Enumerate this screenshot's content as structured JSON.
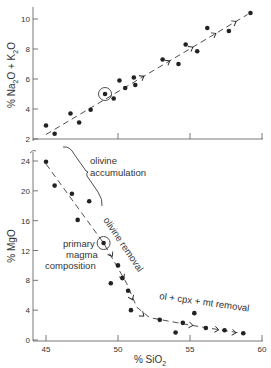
{
  "figure": {
    "width": 271,
    "height": 368,
    "ink_color": "#222222",
    "axis_color": "#555555",
    "text_color": "#333333"
  },
  "chart_data": [
    {
      "type": "scatter",
      "title": "",
      "xlabel": "% SiO2",
      "ylabel": "% Na2O + K2O",
      "xlim": [
        45,
        60
      ],
      "ylim": [
        2,
        10.5
      ],
      "x_ticks": [
        45,
        50,
        55,
        60
      ],
      "y_ticks": [
        2,
        4,
        6,
        8,
        10
      ],
      "y_tick_labels": [
        "2",
        "4",
        "6",
        "8",
        "10"
      ],
      "grid": false,
      "legend": null,
      "series": [
        {
          "name": "samples",
          "points": [
            [
              45.0,
              2.9
            ],
            [
              45.6,
              2.35
            ],
            [
              46.7,
              3.7
            ],
            [
              47.3,
              3.1
            ],
            [
              48.1,
              3.95
            ],
            [
              49.1,
              5.0
            ],
            [
              49.7,
              4.7
            ],
            [
              50.1,
              5.9
            ],
            [
              50.5,
              5.4
            ],
            [
              51.1,
              6.1
            ],
            [
              51.2,
              5.6
            ],
            [
              53.1,
              7.3
            ],
            [
              54.2,
              7.0
            ],
            [
              54.7,
              8.3
            ],
            [
              55.5,
              7.85
            ],
            [
              56.2,
              9.4
            ],
            [
              57.7,
              9.2
            ],
            [
              59.2,
              10.4
            ]
          ]
        }
      ],
      "highlighted_point": {
        "label": "primary magma composition",
        "x": 49.1,
        "y": 5.0
      },
      "trend_line": {
        "style": "dashed-with-arrows",
        "from": [
          45.0,
          2.3
        ],
        "to": [
          59.0,
          10.3
        ],
        "arrows_at_x": [
          51.8,
          53.6,
          55.2,
          56.8,
          58.2
        ]
      }
    },
    {
      "type": "scatter",
      "title": "",
      "xlabel": "% SiO2",
      "ylabel": "% MgO",
      "xlim": [
        44.5,
        60
      ],
      "ylim": [
        0,
        26
      ],
      "x_ticks": [
        45,
        50,
        55,
        60
      ],
      "x_tick_labels": [
        "45",
        "50",
        "55",
        "60"
      ],
      "y_ticks": [
        0,
        4,
        8,
        12,
        16,
        20,
        24
      ],
      "y_tick_labels": [
        "0",
        "4",
        "8",
        "12",
        "16",
        "20",
        "24"
      ],
      "grid": false,
      "legend": null,
      "series": [
        {
          "name": "samples",
          "points": [
            [
              45.0,
              23.9
            ],
            [
              45.6,
              20.7
            ],
            [
              46.8,
              19.6
            ],
            [
              48.0,
              18.6
            ],
            [
              47.2,
              16.1
            ],
            [
              49.0,
              13.0
            ],
            [
              50.0,
              10.0
            ],
            [
              49.5,
              7.6
            ],
            [
              50.3,
              8.3
            ],
            [
              50.7,
              6.6
            ],
            [
              50.9,
              4.0
            ],
            [
              52.9,
              2.7
            ],
            [
              54.0,
              1.0
            ],
            [
              54.5,
              2.3
            ],
            [
              55.3,
              3.6
            ],
            [
              56.1,
              1.6
            ],
            [
              57.4,
              1.3
            ],
            [
              58.7,
              0.9
            ]
          ]
        }
      ],
      "highlighted_point": {
        "label": "primary magma composition",
        "x": 49.0,
        "y": 13.0
      },
      "trend_line": {
        "style": "dashed-with-arrows",
        "path": [
          [
            45.0,
            23.6
          ],
          [
            49.0,
            13.0
          ],
          [
            50.6,
            7.6
          ],
          [
            51.3,
            4.4
          ],
          [
            52.2,
            3.0
          ],
          [
            55.0,
            2.0
          ],
          [
            58.6,
            0.9
          ]
        ],
        "arrows_at": [
          [
            49.6,
            11.2
          ],
          [
            50.4,
            8.2
          ],
          [
            51.0,
            5.4
          ],
          [
            51.8,
            3.2
          ],
          [
            55.2,
            1.95
          ],
          [
            57.0,
            1.35
          ],
          [
            58.2,
            0.95
          ]
        ]
      },
      "annotations": [
        {
          "text": "olivine",
          "x": 90,
          "y": 164,
          "rotate": 0
        },
        {
          "text": "accumulation",
          "x": 90,
          "y": 176,
          "rotate": 0
        },
        {
          "text": "olivine removal",
          "x": 103,
          "y": 220,
          "rotate": 56
        },
        {
          "text": "primary",
          "x": 63,
          "y": 247,
          "rotate": 0
        },
        {
          "text": "magma",
          "x": 66,
          "y": 258,
          "rotate": 0
        },
        {
          "text": "composition",
          "x": 45,
          "y": 269,
          "rotate": 0
        },
        {
          "text": "ol + cpx + mt removal",
          "x": 159,
          "y": 299,
          "rotate": 8
        }
      ]
    }
  ],
  "labels": {
    "top_ylabel_prefix": "% Na",
    "top_ylabel_sub1": "2",
    "top_ylabel_mid": "O + K",
    "top_ylabel_sub2": "2",
    "top_ylabel_suffix": "O",
    "bottom_ylabel": "% MgO",
    "xlabel_prefix": "% SiO",
    "xlabel_sub": "2"
  }
}
